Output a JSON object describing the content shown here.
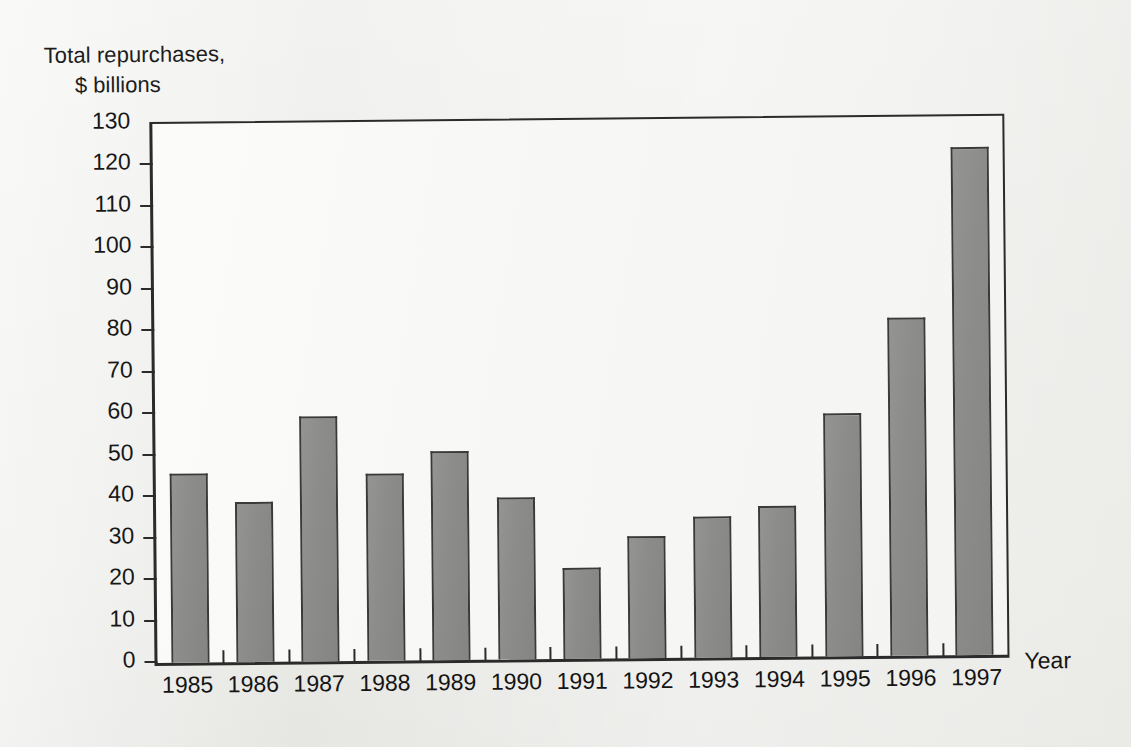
{
  "chart_data": {
    "type": "bar",
    "title": "Total repurchases, $ billions",
    "title_line1": "Total repurchases,",
    "title_line2": "$ billions",
    "xlabel": "Year",
    "ylabel": "Total repurchases, $ billions",
    "categories": [
      "1985",
      "1986",
      "1987",
      "1988",
      "1989",
      "1990",
      "1991",
      "1992",
      "1993",
      "1994",
      "1995",
      "1996",
      "1997"
    ],
    "values": [
      45.5,
      38.5,
      59,
      45,
      50.5,
      39,
      22,
      29.5,
      34,
      36.5,
      58.5,
      81.5,
      122.5
    ],
    "ylim": [
      0,
      130
    ],
    "ytick_labels": [
      "0",
      "10",
      "20",
      "30",
      "40",
      "50",
      "60",
      "70",
      "80",
      "90",
      "100",
      "110",
      "120",
      "130"
    ],
    "ytick_values": [
      0,
      10,
      20,
      30,
      40,
      50,
      60,
      70,
      80,
      90,
      100,
      110,
      120,
      130
    ],
    "grid": false,
    "legend": false,
    "bar_fill": "#8c8c8a",
    "bar_border": "#3a3a3a",
    "axis_color": "#2b2b2b",
    "plot_background": "#f8f8f6",
    "page_background": "#efefed"
  }
}
